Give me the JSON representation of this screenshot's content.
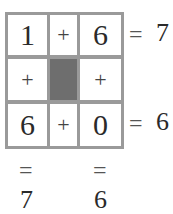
{
  "puzzle": {
    "rows": [
      {
        "a": "1",
        "op": "+",
        "b": "6",
        "eq": "=",
        "result": "7"
      },
      {
        "a": "+",
        "op": "",
        "b": "+"
      },
      {
        "a": "6",
        "op": "+",
        "b": "0",
        "eq": "=",
        "result": "6"
      }
    ],
    "columns": [
      {
        "eq": "=",
        "result": "7"
      },
      {
        "eq": "=",
        "result": "6"
      }
    ],
    "colors": {
      "border": "#9a9a9a",
      "shaded_cell": "#6e6e6e",
      "text": "#2a2a2a"
    }
  }
}
